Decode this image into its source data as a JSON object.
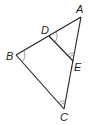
{
  "diagram": {
    "type": "geometry-triangle",
    "points": {
      "A": {
        "label": "A",
        "x": 81,
        "y": 17
      },
      "B": {
        "label": "B",
        "x": 16,
        "y": 55
      },
      "C": {
        "label": "C",
        "x": 64,
        "y": 109
      },
      "D": {
        "label": "D",
        "x": 49,
        "y": 36
      },
      "E": {
        "label": "E",
        "x": 73,
        "y": 61
      }
    },
    "segments": [
      "AB",
      "BC",
      "CA",
      "DE"
    ],
    "angle_marks": [
      {
        "vertex": "B",
        "arcs": 1
      },
      {
        "vertex": "D",
        "angle": "ADE",
        "arcs": 1
      },
      {
        "vertex": "E",
        "angle": "AED",
        "arcs": 2
      },
      {
        "vertex": "C",
        "arcs": 2
      }
    ],
    "colors": {
      "line": "#231f20",
      "arc": "#555555",
      "background": "#ffffff"
    }
  }
}
